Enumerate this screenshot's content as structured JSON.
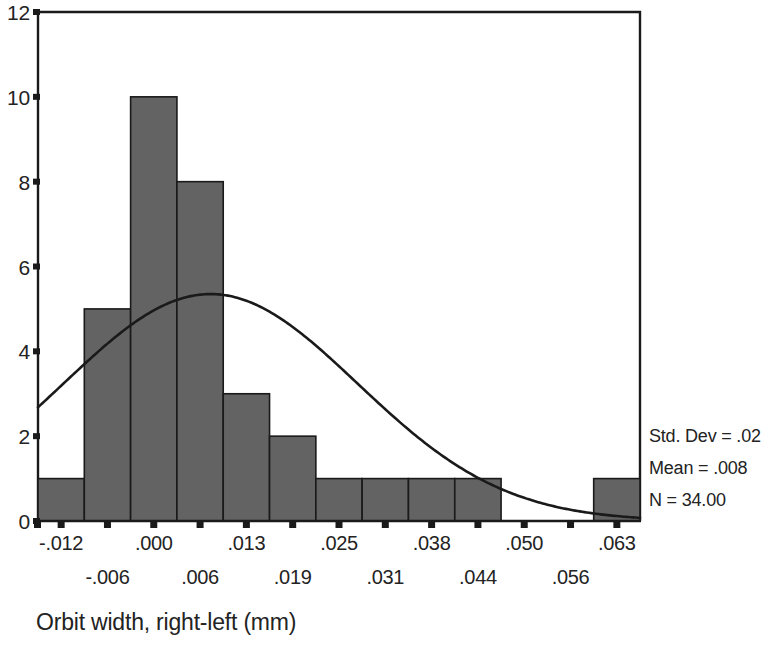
{
  "chart_data": {
    "type": "bar",
    "title": "",
    "subtitle": "",
    "xlabel": "Orbit width, right-left (mm)",
    "ylabel": "",
    "categories": [
      "-.012",
      "-.006",
      ".000",
      ".006",
      ".013",
      ".019",
      ".025",
      ".031",
      ".038",
      ".044",
      ".050",
      ".056",
      ".063"
    ],
    "values": [
      1,
      5,
      10,
      8,
      3,
      2,
      1,
      1,
      1,
      1,
      0,
      0,
      1
    ],
    "bin_centers": [
      -0.012,
      -0.006,
      0.0,
      0.006,
      0.013,
      0.019,
      0.025,
      0.031,
      0.038,
      0.044,
      0.05,
      0.056,
      0.063
    ],
    "xlim": [
      -0.0155,
      0.0665
    ],
    "ylim": [
      0,
      12
    ],
    "yticks": [
      0,
      2,
      4,
      6,
      8,
      10,
      12
    ],
    "ytick_labels": [
      "0",
      "2",
      "4",
      "6",
      "8",
      "10",
      "12"
    ],
    "xtick_labels_row0": [
      "-.012",
      "",
      ".000",
      "",
      ".013",
      "",
      ".025",
      "",
      ".038",
      "",
      ".050",
      "",
      ".063"
    ],
    "xtick_labels_row1": [
      "",
      "-.006",
      "",
      ".006",
      "",
      ".019",
      "",
      ".031",
      "",
      ".044",
      "",
      ".056",
      ""
    ],
    "grid": false,
    "legend_position": "right",
    "bar_color": "#636363",
    "bar_edge_color": "#1a1a1a",
    "curve_color": "#1a1a1a",
    "overlay": {
      "name": "normal curve",
      "type": "line",
      "mean": 0.008,
      "std_dev": 0.02,
      "n": 34,
      "peak_value": 5.35
    },
    "annotations": [
      "Std. Dev = .02",
      "Mean = .008",
      "N = 34.00"
    ]
  },
  "stats_box": {
    "std_dev_label": "Std. Dev = .02",
    "mean_label": "Mean = .008",
    "n_label": "N = 34.00"
  },
  "axes": {
    "x_title": "Orbit width, right-left (mm)",
    "y_ticks": [
      "0",
      "2",
      "4",
      "6",
      "8",
      "10",
      "12"
    ],
    "x_ticks": [
      "-.012",
      "-.006",
      ".000",
      ".006",
      ".013",
      ".019",
      ".025",
      ".031",
      ".038",
      ".044",
      ".050",
      ".056",
      ".063"
    ]
  },
  "colors": {
    "bar_fill": "#636363",
    "bar_stroke": "#1a1a1a",
    "axis": "#1a1a1a",
    "curve": "#1a1a1a",
    "text": "#232323",
    "background": "#ffffff"
  }
}
